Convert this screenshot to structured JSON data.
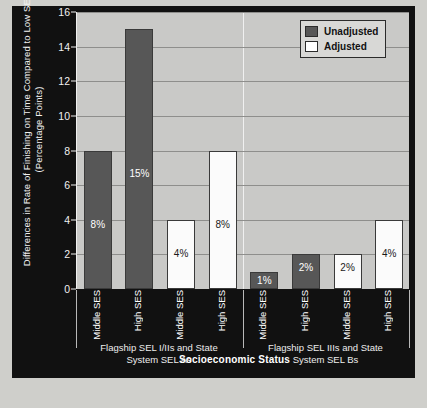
{
  "chart_data": {
    "type": "bar",
    "title": "",
    "xlabel": "Socioeconomic Status",
    "ylabel": "Differences in Rate of Finishing on Time Compared to Low SES (Percentage Points)",
    "ylim": [
      0,
      16
    ],
    "yticks": [
      0,
      2,
      4,
      6,
      8,
      10,
      12,
      14,
      16
    ],
    "grid": true,
    "legend_position": "top-right",
    "categories": [
      "Middle SES",
      "High SES",
      "Middle SES",
      "High SES",
      "Middle SES",
      "High SES",
      "Middle SES",
      "High SES"
    ],
    "groups": [
      {
        "label": "Flagship SEL I/IIs and State System SEL As",
        "line1": "Flagship SEL I/IIs and State",
        "line2": "System SEL As"
      },
      {
        "label": "Flagship SEL IIIs and State System SEL Bs",
        "line1": "Flagship SEL IIIs and State",
        "line2": "System SEL Bs"
      }
    ],
    "series": [
      {
        "name": "Unadjusted",
        "color": "#575757"
      },
      {
        "name": "Adjusted",
        "color": "#ffffff"
      }
    ],
    "bars": [
      {
        "group": 0,
        "series": "Unadjusted",
        "category": "Middle SES",
        "value": 8,
        "data_label": "8%"
      },
      {
        "group": 0,
        "series": "Unadjusted",
        "category": "High SES",
        "value": 15,
        "data_label": "15%"
      },
      {
        "group": 0,
        "series": "Adjusted",
        "category": "Middle SES",
        "value": 4,
        "data_label": "4%"
      },
      {
        "group": 0,
        "series": "Adjusted",
        "category": "High SES",
        "value": 8,
        "data_label": "8%"
      },
      {
        "group": 1,
        "series": "Unadjusted",
        "category": "Middle SES",
        "value": 1,
        "data_label": "1%"
      },
      {
        "group": 1,
        "series": "Unadjusted",
        "category": "High SES",
        "value": 2,
        "data_label": "2%"
      },
      {
        "group": 1,
        "series": "Adjusted",
        "category": "Middle SES",
        "value": 2,
        "data_label": "2%"
      },
      {
        "group": 1,
        "series": "Adjusted",
        "category": "High SES",
        "value": 4,
        "data_label": "4%"
      }
    ]
  },
  "legend": {
    "items": [
      {
        "label": "Unadjusted",
        "swatch": "unadjusted"
      },
      {
        "label": "Adjusted",
        "swatch": "adjusted"
      }
    ]
  },
  "colors": {
    "unadjusted": "#575857",
    "adjusted": "#ffffff",
    "plot_background": "#c9c9c7",
    "frame_background": "#111111",
    "gridline": "#8e8e8c"
  }
}
